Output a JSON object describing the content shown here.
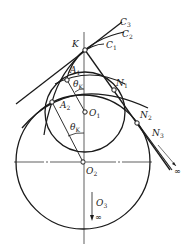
{
  "diagram": {
    "colors": {
      "stroke": "#1a1a1a",
      "background": "#ffffff"
    },
    "points": {
      "K": {
        "label": "K"
      },
      "A1": {
        "label": "A",
        "sub": "1"
      },
      "A2": {
        "label": "A",
        "sub": "2"
      },
      "O1": {
        "label": "O",
        "sub": "1"
      },
      "O2": {
        "label": "O",
        "sub": "2"
      },
      "N1": {
        "label": "N",
        "sub": "1"
      },
      "N2": {
        "label": "N",
        "sub": "2"
      },
      "N3": {
        "label": "N",
        "sub": "3"
      },
      "O3": {
        "label": "O",
        "sub": "3"
      }
    },
    "curves": {
      "C1": {
        "label": "C",
        "sub": "1"
      },
      "C2": {
        "label": "C",
        "sub": "2"
      },
      "C3": {
        "label": "C",
        "sub": "3"
      }
    },
    "angles": {
      "upper": {
        "label": "θ",
        "sub": "K"
      },
      "lower": {
        "label": "θ",
        "sub": "K"
      }
    },
    "infinity": {
      "symbol": "∞"
    }
  }
}
